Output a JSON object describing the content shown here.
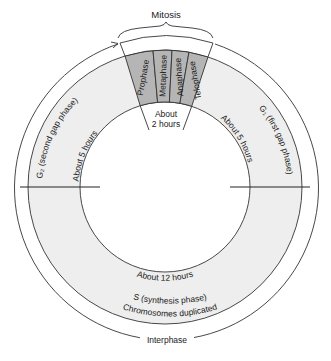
{
  "diagram": {
    "title": "Mitosis",
    "outer_label": "Interphase",
    "mitosis_phases": [
      {
        "label": "Prophase"
      },
      {
        "label": "Metaphase"
      },
      {
        "label": "Anaphase"
      },
      {
        "label": "Telophase"
      }
    ],
    "mitosis_duration_line1": "About",
    "mitosis_duration_line2": "2 hours",
    "g1": {
      "label": "G₁ (first gap phase)",
      "duration": "About 5 hours"
    },
    "g2": {
      "label": "G₂ (second gap phase)",
      "duration": "About 5 hours"
    },
    "s": {
      "line1": "S (synthesis phase)",
      "line2": "Chromosomes duplicated",
      "duration": "About 12 hours"
    },
    "colors": {
      "ring_fill": "#eeeeee",
      "mitosis_fill": "#b5b5b5",
      "line": "#333333",
      "background": "#ffffff"
    }
  }
}
